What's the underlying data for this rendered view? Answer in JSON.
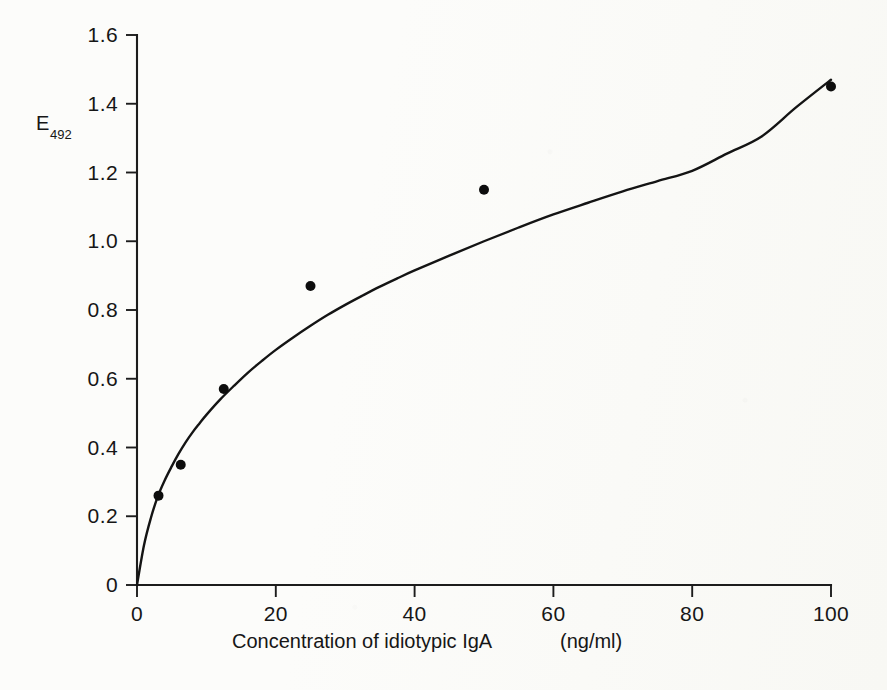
{
  "figure": {
    "background_color": "#fcfcfa",
    "ink_color": "#141414"
  },
  "chart_data": {
    "type": "scatter",
    "title": "",
    "subtitle": "",
    "xlabel": "Concentration of idiotypic IgA  (ng/ml)",
    "xlabel_main": "Concentration of idiotypic IgA",
    "xlabel_units": "(ng/ml)",
    "ylabel": "E492",
    "ylabel_base": "E",
    "ylabel_subscript": "492",
    "xlim": [
      0,
      100
    ],
    "ylim": [
      0,
      1.6
    ],
    "grid": false,
    "legend": false,
    "legend_position": "none",
    "xticks": [
      0,
      20,
      40,
      60,
      80,
      100
    ],
    "xticklabels": [
      "0",
      "20",
      "40",
      "60",
      "80",
      "100"
    ],
    "yticks": [
      0,
      0.2,
      0.4,
      0.6,
      0.8,
      1.0,
      1.2,
      1.4,
      1.6
    ],
    "yticklabels": [
      "0",
      "0.2",
      "0.4",
      "0.6",
      "0.8",
      "1.0",
      "1.2",
      "1.4",
      "1.6"
    ],
    "x": [
      3.1,
      6.3,
      12.5,
      25,
      50,
      100
    ],
    "y": [
      0.26,
      0.35,
      0.57,
      0.87,
      1.15,
      1.45
    ],
    "points": [
      {
        "x": 3.1,
        "y": 0.26
      },
      {
        "x": 6.3,
        "y": 0.35
      },
      {
        "x": 12.5,
        "y": 0.57
      },
      {
        "x": 25,
        "y": 0.87
      },
      {
        "x": 50,
        "y": 1.15
      },
      {
        "x": 100,
        "y": 1.45
      }
    ],
    "fit_curve": {
      "description": "saturation binding curve through origin",
      "x": [
        0,
        1,
        2,
        3,
        4,
        5,
        6,
        7,
        8,
        9,
        10,
        12,
        14,
        16,
        18,
        20,
        22.5,
        25,
        27.5,
        30,
        32.5,
        35,
        37.5,
        40,
        45,
        50,
        55,
        60,
        65,
        70,
        75,
        80,
        85,
        90,
        95,
        100
      ],
      "y": [
        0,
        0.115,
        0.195,
        0.258,
        0.305,
        0.345,
        0.382,
        0.415,
        0.444,
        0.47,
        0.495,
        0.54,
        0.58,
        0.618,
        0.652,
        0.684,
        0.72,
        0.754,
        0.786,
        0.815,
        0.842,
        0.868,
        0.892,
        0.915,
        0.958,
        1.0,
        1.04,
        1.078,
        1.112,
        1.145,
        1.175,
        1.205,
        1.255,
        1.305,
        1.39,
        1.47
      ]
    },
    "annotations": []
  },
  "axes": {
    "y_axis_name": "y-axis",
    "x_axis_name": "x-axis"
  }
}
